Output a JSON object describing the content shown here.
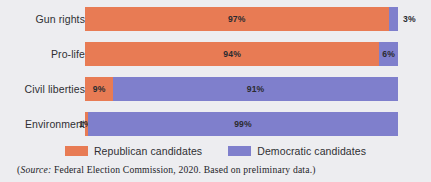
{
  "chart_data": {
    "type": "bar",
    "subtype": "stacked-horizontal-100",
    "title": "",
    "xlabel": "",
    "ylabel": "",
    "xlim": [
      0,
      100
    ],
    "grid": false,
    "legend_position": "bottom-center",
    "categories": [
      "Gun rights",
      "Pro-life",
      "Civil liberties",
      "Environment"
    ],
    "series": [
      {
        "name": "Republican candidates",
        "color": "#e87b54",
        "values": [
          97,
          94,
          9,
          1
        ]
      },
      {
        "name": "Democratic candidates",
        "color": "#7f7fcc",
        "values": [
          3,
          6,
          91,
          99
        ]
      }
    ],
    "value_labels": [
      [
        "97%",
        "3%"
      ],
      [
        "94%",
        "6%"
      ],
      [
        "9%",
        "91%"
      ],
      [
        "1%",
        "99%"
      ]
    ],
    "annotations": [
      "(Source: Federal Election Commission, 2020. Based on preliminary data.)"
    ]
  },
  "rows": [
    {
      "label": "Gun rights",
      "segments": [
        {
          "party": "rep",
          "value": 97,
          "label": "97%",
          "label_placement": "inside"
        },
        {
          "party": "dem",
          "value": 3,
          "label": "3%",
          "label_placement": "outside-right"
        }
      ]
    },
    {
      "label": "Pro-life",
      "segments": [
        {
          "party": "rep",
          "value": 94,
          "label": "94%",
          "label_placement": "inside"
        },
        {
          "party": "dem",
          "value": 6,
          "label": "6%",
          "label_placement": "inside"
        }
      ]
    },
    {
      "label": "Civil liberties",
      "segments": [
        {
          "party": "rep",
          "value": 9,
          "label": "9%",
          "label_placement": "inside"
        },
        {
          "party": "dem",
          "value": 91,
          "label": "91%",
          "label_placement": "inside"
        }
      ]
    },
    {
      "label": "Environment",
      "segments": [
        {
          "party": "rep",
          "value": 1,
          "label": "1%",
          "label_placement": "at-start"
        },
        {
          "party": "dem",
          "value": 99,
          "label": "99%",
          "label_placement": "inside"
        }
      ]
    }
  ],
  "legend": {
    "items": [
      {
        "label": "Republican candidates",
        "party": "rep",
        "color": "#e87b54"
      },
      {
        "label": "Democratic candidates",
        "party": "dem",
        "color": "#7f7fcc"
      }
    ]
  },
  "source": {
    "open_paren": "(",
    "source_word": "Source:",
    "text": " Federal Election Commission, 2020. Based on preliminary data.)"
  },
  "colors": {
    "background": "#ededf0",
    "republican": "#e87b54",
    "democratic": "#7f7fcc",
    "text": "#2f2f33"
  }
}
